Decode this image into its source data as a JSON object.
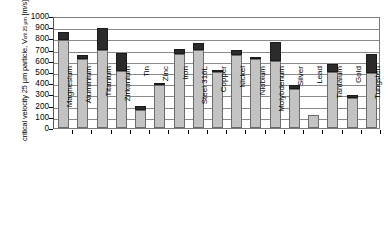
{
  "chart_data": {
    "type": "bar",
    "title": "",
    "xlabel": "",
    "ylabel": "critical velocity 25 µm particle, Vcrit 25 µm [m/s]",
    "ylabel_main": "critical velocity 25 µm particle, V",
    "ylabel_sub": "crit 25 µm",
    "ylabel_unit": " [m/s]",
    "ylim": [
      0,
      1000
    ],
    "yticks": [
      0,
      100,
      200,
      300,
      400,
      500,
      600,
      700,
      800,
      900,
      1000
    ],
    "grid": true,
    "legend": "none",
    "stacked": true,
    "categories": [
      "Magnesium",
      "Aluminium",
      "Titanium",
      "Zirkonium",
      "Tin",
      "Zinc",
      "Iron",
      "Steel 316L",
      "Copper",
      "Nickel",
      "Niobium",
      "Molybdenum",
      "Silver",
      "Lead",
      "Tantalum",
      "Gold",
      "Tungsten"
    ],
    "series": [
      {
        "name": "lower range (light gray)",
        "values": [
          790,
          620,
          695,
          510,
          165,
          385,
          660,
          700,
          500,
          655,
          615,
          600,
          345,
          120,
          500,
          265,
          490
        ]
      },
      {
        "name": "upper range (dark)",
        "values": [
          65,
          35,
          195,
          160,
          30,
          5,
          50,
          60,
          20,
          45,
          20,
          170,
          35,
          0,
          70,
          30,
          170
        ]
      }
    ],
    "totals": [
      855,
      655,
      890,
      670,
      195,
      390,
      710,
      760,
      520,
      700,
      635,
      770,
      380,
      120,
      570,
      295,
      660
    ]
  }
}
